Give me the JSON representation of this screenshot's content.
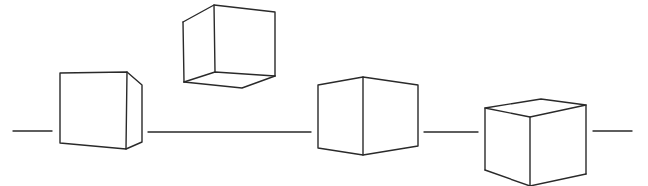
{
  "diagram": {
    "stroke_color": "#2a2a2a",
    "background": "#ffffff",
    "horizontal_line_segments": [
      {
        "x1": 13,
        "x2": 52,
        "y": 131
      },
      {
        "x1": 148,
        "x2": 311,
        "y": 132
      },
      {
        "x1": 424,
        "x2": 478,
        "y": 132
      },
      {
        "x1": 593,
        "x2": 632,
        "y": 131
      }
    ],
    "cubes": [
      {
        "name": "cube-1",
        "view": "front face with right side visible"
      },
      {
        "name": "cube-2",
        "view": "viewed from below, floating"
      },
      {
        "name": "cube-3",
        "view": "edge-on, two side faces"
      },
      {
        "name": "cube-4",
        "view": "viewed from above"
      }
    ]
  }
}
